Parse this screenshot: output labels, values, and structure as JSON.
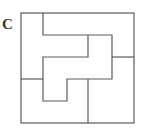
{
  "figure": {
    "label": "C",
    "stroke_color": "#5a5a5a",
    "background": "#ffffff"
  },
  "diagram": {
    "type": "square-dissection-puzzle",
    "outer_square": {
      "x": 21,
      "y": 13,
      "width": 113,
      "height": 110
    },
    "pieces": [
      {
        "name": "top-right-piece",
        "points": "43,13 134,13 134,57 112,57 112,35 43,35"
      },
      {
        "name": "left-piece",
        "points": "21,13 43,13 43,35 88,35 88,57 43,57 43,79 21,79"
      },
      {
        "name": "center-piece",
        "points": "43,57 88,57 88,35 112,35 112,79 67,79 67,101 43,101"
      },
      {
        "name": "right-piece",
        "points": "112,57 134,57 134,123 88,123 88,79 112,79"
      },
      {
        "name": "bottom-left-piece",
        "points": "21,79 43,79 43,101 67,101 67,79 88,79 88,123 21,123"
      }
    ]
  }
}
